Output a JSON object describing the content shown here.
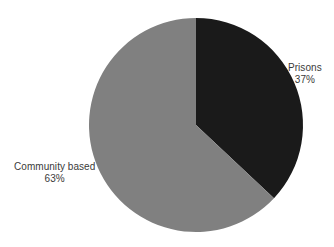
{
  "chart_data": {
    "type": "pie",
    "title": "",
    "subtitle": "",
    "xlabel": "",
    "ylabel": "",
    "legend_position": "none",
    "grid": false,
    "units": "percent",
    "total": 100,
    "start_angle_deg": 0,
    "direction": "clockwise",
    "categories": [
      "Prisons",
      "Community based"
    ],
    "values": [
      37,
      63
    ],
    "slices": [
      {
        "label": "Prisons",
        "value": 37,
        "value_label": "37%",
        "color": "#1a1a1a",
        "start_angle_deg": 0,
        "end_angle_deg": 133.2,
        "label_position": "right"
      },
      {
        "label": "Community based",
        "value": 63,
        "value_label": "63%",
        "color": "#808080",
        "start_angle_deg": 133.2,
        "end_angle_deg": 360,
        "label_position": "left"
      }
    ],
    "geometry": {
      "center_x": 196,
      "center_y": 125,
      "radius": 107
    },
    "colors": {
      "background": "#ffffff",
      "text": "#3a3a3a",
      "slice_dark": "#1a1a1a",
      "slice_gray": "#808080"
    }
  }
}
